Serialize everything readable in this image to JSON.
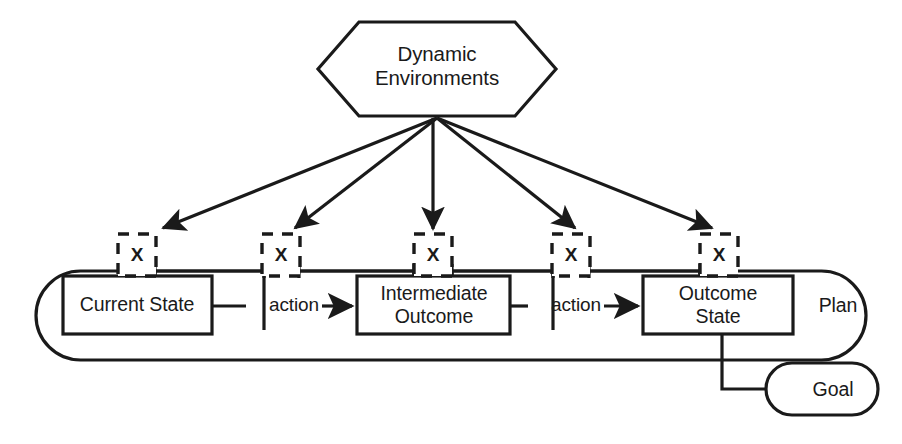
{
  "diagram": {
    "colors": {
      "stroke": "#1a1a1a",
      "background": "#ffffff",
      "text": "#1a1a1a"
    },
    "environment": {
      "shape": "hexagon",
      "label": "Dynamic\nEnvironments"
    },
    "plan": {
      "container_label": "Plan",
      "shape": "stadium",
      "nodes": [
        {
          "id": "current-state",
          "label": "Current State"
        },
        {
          "id": "intermediate-outcome",
          "label": "Intermediate\nOutcome"
        },
        {
          "id": "outcome-state",
          "label": "Outcome\nState"
        }
      ],
      "transitions": [
        {
          "id": "action-1",
          "label": "action",
          "from": "current-state",
          "to": "intermediate-outcome"
        },
        {
          "id": "action-2",
          "label": "action",
          "from": "intermediate-outcome",
          "to": "outcome-state"
        }
      ]
    },
    "interference_points": [
      {
        "id": "x-1",
        "label": "X"
      },
      {
        "id": "x-2",
        "label": "X"
      },
      {
        "id": "x-3",
        "label": "X"
      },
      {
        "id": "x-4",
        "label": "X"
      },
      {
        "id": "x-5",
        "label": "X"
      }
    ],
    "goal": {
      "shape": "stadium",
      "label": "Goal",
      "connected_from": "outcome-state"
    },
    "arrows": {
      "count_from_environment": 5,
      "style": "solid-filled-head"
    }
  }
}
